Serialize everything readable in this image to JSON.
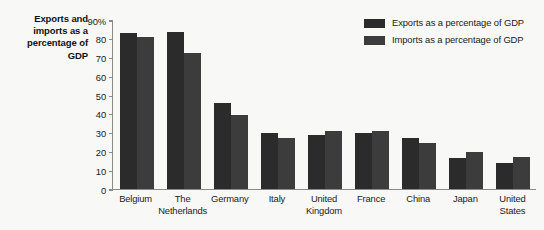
{
  "chart_data": {
    "type": "bar",
    "title_lines": [
      "Exports and",
      "imports as a",
      "percentage of",
      "GDP"
    ],
    "xlabel": "",
    "ylabel": "",
    "ylim": [
      0,
      90
    ],
    "yticks": [
      0,
      10,
      20,
      30,
      40,
      50,
      60,
      70,
      80,
      90
    ],
    "ytick_labels": [
      "0",
      "10",
      "20",
      "30",
      "40",
      "50",
      "60",
      "70",
      "80",
      "90%"
    ],
    "grid": false,
    "legend_position": "top-right",
    "categories": [
      "Belgium",
      "The Netherlands",
      "Germany",
      "Italy",
      "United Kingdom",
      "France",
      "China",
      "Japan",
      "United States"
    ],
    "category_lines": [
      [
        "Belgium"
      ],
      [
        "The",
        "Netherlands"
      ],
      [
        "Germany"
      ],
      [
        "Italy"
      ],
      [
        "United",
        "Kingdom"
      ],
      [
        "France"
      ],
      [
        "China"
      ],
      [
        "Japan"
      ],
      [
        "United",
        "States"
      ]
    ],
    "series": [
      {
        "name": "Exports as a percentage of GDP",
        "color": "#2b2b2b",
        "values": [
          83,
          83.5,
          46,
          30,
          29,
          30,
          27,
          16.5,
          14
        ]
      },
      {
        "name": "Imports as a percentage of GDP",
        "color": "#3c3c3c",
        "values": [
          81,
          72.5,
          39.5,
          27,
          31,
          31,
          24.5,
          19.5,
          17
        ]
      }
    ]
  },
  "colors": {
    "background": "#f8f8f6",
    "axis": "#8a8a8a",
    "text": "#1a1a1a",
    "exports": "#2b2b2b",
    "imports": "#3c3c3c"
  }
}
